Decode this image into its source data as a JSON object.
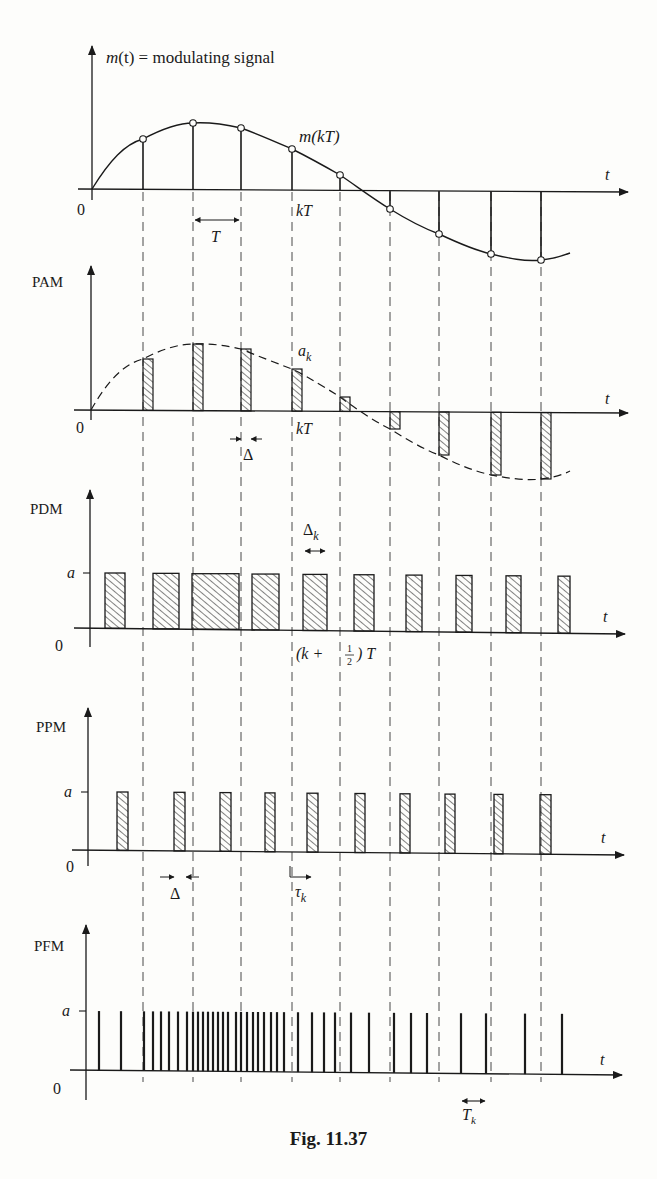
{
  "figure": {
    "caption": "Fig. 11.37",
    "ink_color": "#1a1a1a",
    "background": "#fdfdfb"
  },
  "panels": {
    "signal": {
      "ylabel_m": "m",
      "ylabel_t": "(t)",
      "ylabel_rest": " = modulating signal",
      "origin": "0",
      "xlabel": "t",
      "sample_label": "m(kT)",
      "time_label": "kT",
      "period_label": "T"
    },
    "pam": {
      "ylabel": "PAM",
      "origin": "0",
      "xlabel": "t",
      "amp_label_a": "a",
      "amp_label_k": "k",
      "time_label": "kT",
      "width_label": "Δ"
    },
    "pdm": {
      "ylabel": "PDM",
      "origin": "0",
      "xlabel": "t",
      "level_label": "a",
      "width_label_delta": "Δ",
      "width_label_k": "k",
      "center_label_open": "(k + ",
      "center_label_num": "1",
      "center_label_den": "2",
      "center_label_close": ") T"
    },
    "ppm": {
      "ylabel": "PPM",
      "origin": "0",
      "xlabel": "t",
      "level_label": "a",
      "width_label": "Δ",
      "shift_label_tau": "τ",
      "shift_label_k": "k"
    },
    "pfm": {
      "ylabel": "PFM",
      "origin": "0",
      "xlabel": "t",
      "level_label": "a",
      "period_label_T": "T",
      "period_label_k": "k"
    }
  },
  "chart_data": {
    "type": "diagram",
    "title": "Fig. 11.37",
    "sample_x": [
      143,
      193,
      241,
      292,
      340,
      390,
      439,
      491,
      541
    ],
    "signal_samples_y": [
      139,
      123,
      128,
      149,
      175,
      209,
      234,
      254,
      260
    ],
    "pam_bar_tops_y": [
      359,
      344,
      349,
      369,
      397,
      429,
      455,
      475,
      479
    ],
    "pdm_pulses": [
      [
        105,
        125
      ],
      [
        153,
        179
      ],
      [
        192,
        239
      ],
      [
        252,
        279
      ],
      [
        303,
        327
      ],
      [
        354,
        374
      ],
      [
        406,
        422
      ],
      [
        456,
        472
      ],
      [
        506,
        521
      ],
      [
        558,
        570
      ]
    ],
    "ppm_pulses": [
      [
        117,
        128
      ],
      [
        174,
        185
      ],
      [
        220,
        231
      ],
      [
        265,
        275
      ],
      [
        307,
        318
      ],
      [
        355,
        365
      ],
      [
        400,
        410
      ],
      [
        445,
        455
      ],
      [
        494,
        503
      ],
      [
        540,
        551
      ]
    ],
    "pfm_spikes_x": [
      99,
      121,
      144,
      153,
      161,
      169,
      178,
      187,
      193,
      198,
      203,
      208,
      213,
      218,
      223,
      228,
      236,
      241,
      247,
      253,
      258,
      264,
      271,
      277,
      284,
      298,
      312,
      324,
      335,
      351,
      369,
      394,
      411,
      427,
      461,
      486,
      525,
      562
    ]
  }
}
